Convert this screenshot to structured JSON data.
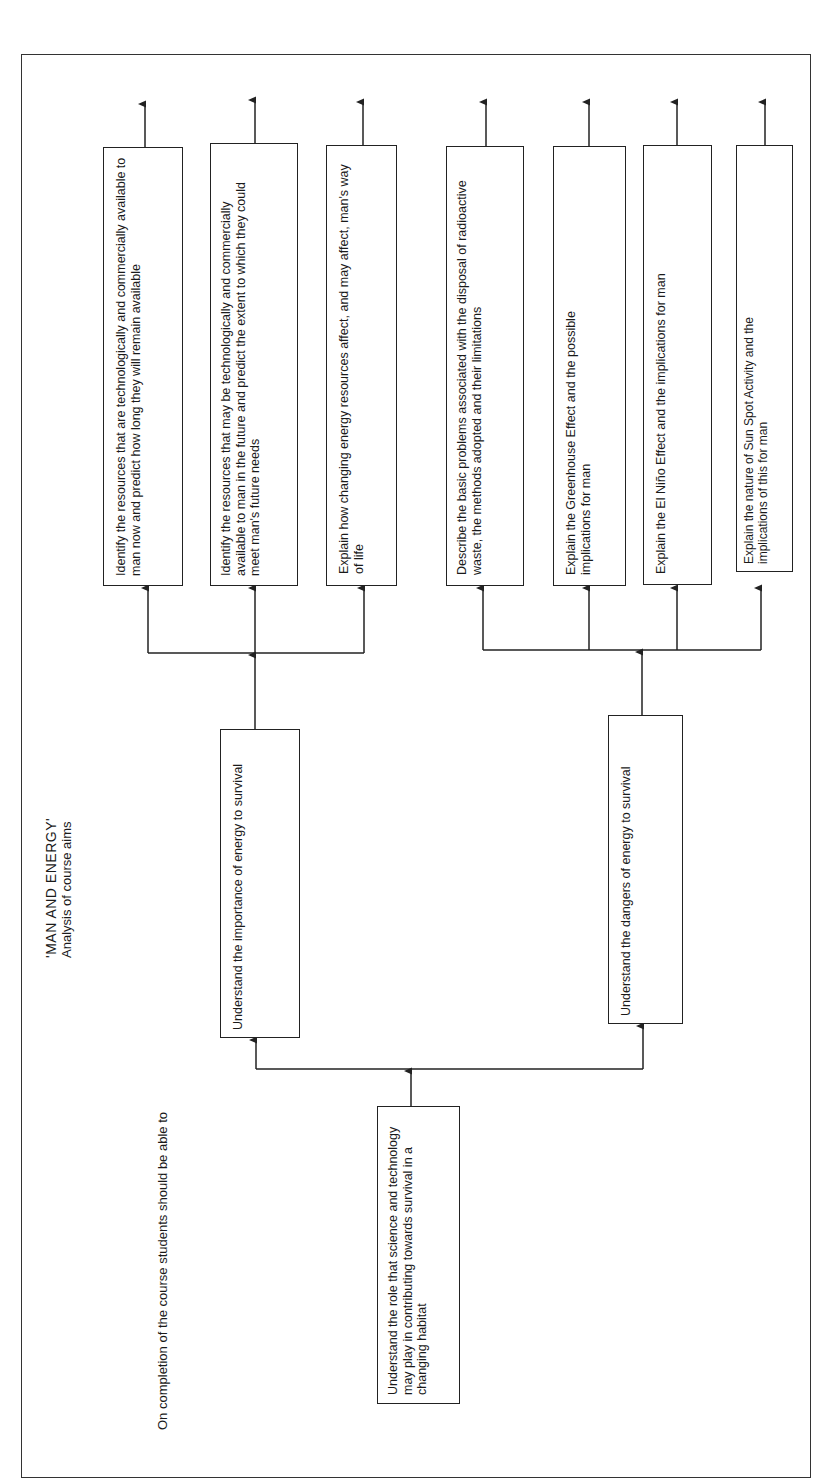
{
  "title": {
    "line1": "'MAN AND ENERGY'",
    "line2": "Analysis of course aims"
  },
  "intro": "On completion of the course students should be able to",
  "root": {
    "label": "Understand the role that science and technology may play in contributing towards survival in a changing habitat"
  },
  "branches": [
    {
      "label": "Understand the importance of energy to survival",
      "children": [
        {
          "label": "Identify the resources that are technologically and commercially available to man now and predict how long they will remain available"
        },
        {
          "label": "Identify the resources that may be technologically and commercially available to man in the future and predict the extent to which they could meet man's future needs"
        },
        {
          "label": "Explain how changing energy resources affect, and may affect, man's way of life"
        }
      ]
    },
    {
      "label": "Understand the dangers of energy to survival",
      "children": [
        {
          "label": "Describe the basic problems associated with the disposal of radioactive waste, the methods adopted and their limitations"
        },
        {
          "label": "Explain the Greenhouse Effect and the possible implications for man"
        },
        {
          "label": "Explain the El Niño Effect and the implications for man"
        },
        {
          "label": "Explain the nature of Sun Spot Activity and the implications of this for man"
        }
      ]
    }
  ],
  "colors": {
    "line": "#222222",
    "background": "#ffffff"
  }
}
